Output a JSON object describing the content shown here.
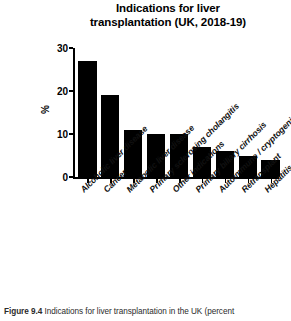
{
  "chart_data": {
    "type": "bar",
    "title": "Indications for liver transplantation (UK, 2018-19)",
    "title_lines": [
      "Indications for liver",
      "transplantation (UK, 2018-19)"
    ],
    "xlabel": "",
    "ylabel": "%",
    "ylim": [
      0,
      30
    ],
    "yticks": [
      0,
      10,
      20,
      30
    ],
    "ytick_labels": [
      "0",
      "10",
      "20",
      "30"
    ],
    "grid": false,
    "legend": false,
    "bar_color": "#000000",
    "categories": [
      "Alcoholic liver disease",
      "Cancer",
      "Metabolic liver disease",
      "Primary sclerosing cholangitis",
      "Other indications",
      "Primary biliary cirrhosis",
      "Autoimmune / cryptogenic",
      "Retransplant",
      "Hepatitis B/C"
    ],
    "values": [
      27,
      19,
      11,
      10,
      10,
      7,
      6,
      5,
      4
    ]
  },
  "caption": {
    "figure_number": "Figure 9.4",
    "text": "Indications for liver transplantation in the UK (percent"
  }
}
